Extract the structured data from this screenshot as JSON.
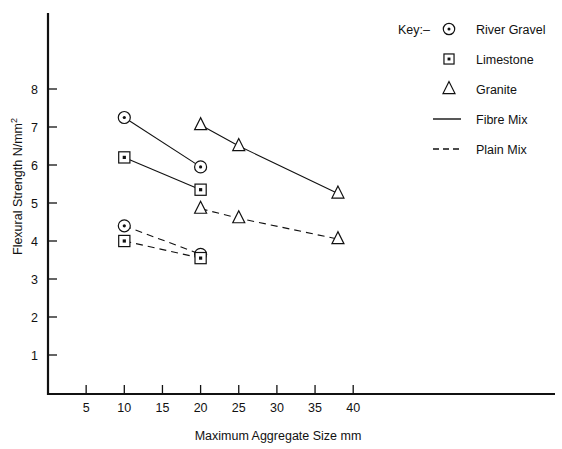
{
  "chart_data": {
    "type": "line",
    "title": "",
    "xlabel": "Maximum Aggregate Size mm",
    "ylabel": "Flexural Strength N/mm²",
    "xlim": [
      0,
      45
    ],
    "ylim": [
      0,
      8.6
    ],
    "xticks": [
      5,
      10,
      15,
      20,
      25,
      30,
      35,
      40
    ],
    "yticks": [
      1,
      2,
      3,
      4,
      5,
      6,
      7,
      8
    ],
    "grid": false,
    "legend_position": "top-right",
    "series": [
      {
        "name": "River Gravel Fibre Mix",
        "aggregate": "River Gravel",
        "mix": "Fibre Mix",
        "marker": "circle-dot",
        "linestyle": "solid",
        "x": [
          10,
          20
        ],
        "values": [
          7.25,
          5.95
        ]
      },
      {
        "name": "Limestone Fibre Mix",
        "aggregate": "Limestone",
        "mix": "Fibre Mix",
        "marker": "square-dot",
        "linestyle": "solid",
        "x": [
          10,
          20
        ],
        "values": [
          6.2,
          5.35
        ]
      },
      {
        "name": "Granite Fibre Mix",
        "aggregate": "Granite",
        "mix": "Fibre Mix",
        "marker": "triangle",
        "linestyle": "solid",
        "x": [
          20,
          25,
          38
        ],
        "values": [
          7.05,
          6.5,
          5.25
        ]
      },
      {
        "name": "River Gravel Plain Mix",
        "aggregate": "River Gravel",
        "mix": "Plain Mix",
        "marker": "circle-dot",
        "linestyle": "dashed",
        "x": [
          10,
          20
        ],
        "values": [
          4.4,
          3.65
        ]
      },
      {
        "name": "Limestone Plain Mix",
        "aggregate": "Limestone",
        "mix": "Plain Mix",
        "marker": "square-dot",
        "linestyle": "dashed",
        "x": [
          10,
          20
        ],
        "values": [
          4.0,
          3.55
        ]
      },
      {
        "name": "Granite Plain Mix",
        "aggregate": "Granite",
        "mix": "Plain Mix",
        "marker": "triangle",
        "linestyle": "dashed",
        "x": [
          20,
          25,
          38
        ],
        "values": [
          4.85,
          4.6,
          4.05
        ]
      }
    ]
  },
  "legend": {
    "key_label": "Key:–",
    "entries": [
      {
        "label": "River Gravel",
        "glyph": "circle-dot-icon"
      },
      {
        "label": "Limestone",
        "glyph": "square-dot-icon"
      },
      {
        "label": "Granite",
        "glyph": "triangle-icon"
      },
      {
        "label": "Fibre Mix",
        "glyph": "solid-line-icon"
      },
      {
        "label": "Plain Mix",
        "glyph": "dashed-line-icon"
      }
    ]
  },
  "axes": {
    "y_title": "Flexural Strength N/mm",
    "y_title_sup": "2",
    "x_title": "Maximum Aggregate Size mm",
    "x_tick_labels": [
      "5",
      "10",
      "15",
      "20",
      "25",
      "30",
      "35",
      "40"
    ],
    "y_tick_labels": [
      "8",
      "7",
      "6",
      "5",
      "4",
      "3",
      "2",
      "1"
    ]
  },
  "colors": {
    "ink": "#111111",
    "background": "#ffffff"
  }
}
